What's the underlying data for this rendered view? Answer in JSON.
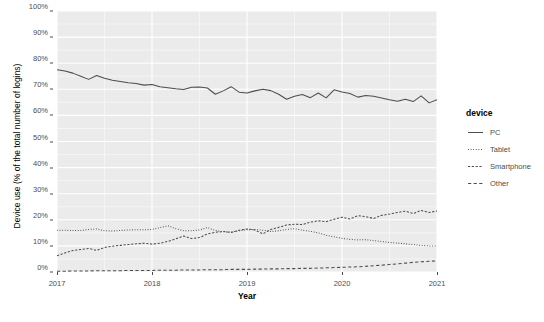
{
  "chart_data": {
    "type": "line",
    "title": "",
    "xlabel": "Year",
    "ylabel": "Device use (% of the total number of logins)",
    "xlim": [
      2017.0,
      2021.0
    ],
    "ylim": [
      0,
      100
    ],
    "grid": true,
    "legend_position": "right",
    "legend_title": "device",
    "x_tick_labels": [
      "2017",
      "2018",
      "2019",
      "2020",
      "2021"
    ],
    "x_tick_values": [
      2017,
      2018,
      2019,
      2020,
      2021
    ],
    "y_tick_labels": [
      "0%",
      "10%",
      "20%",
      "30%",
      "40%",
      "50%",
      "60%",
      "70%",
      "80%",
      "90%",
      "100%"
    ],
    "y_tick_values": [
      0,
      10,
      20,
      30,
      40,
      50,
      60,
      70,
      80,
      90,
      100
    ],
    "x": [
      2017.0,
      2017.083,
      2017.167,
      2017.25,
      2017.333,
      2017.417,
      2017.5,
      2017.583,
      2017.667,
      2017.75,
      2017.833,
      2017.917,
      2018.0,
      2018.083,
      2018.167,
      2018.25,
      2018.333,
      2018.417,
      2018.5,
      2018.583,
      2018.667,
      2018.75,
      2018.833,
      2018.917,
      2019.0,
      2019.083,
      2019.167,
      2019.25,
      2019.333,
      2019.417,
      2019.5,
      2019.583,
      2019.667,
      2019.75,
      2019.833,
      2019.917,
      2020.0,
      2020.083,
      2020.167,
      2020.25,
      2020.333,
      2020.417,
      2020.5,
      2020.583,
      2020.667,
      2020.75,
      2020.833,
      2020.917,
      2021.0
    ],
    "series": [
      {
        "name": "PC",
        "dash": "solid",
        "color": "#4d4d4d",
        "values": [
          77.5,
          77.0,
          76.2,
          75.0,
          73.8,
          75.3,
          74.2,
          73.5,
          73.0,
          72.5,
          72.2,
          71.6,
          71.8,
          71.0,
          70.6,
          70.2,
          69.9,
          70.8,
          70.9,
          70.5,
          68.1,
          69.4,
          71.0,
          68.9,
          68.6,
          69.4,
          70.0,
          69.5,
          68.1,
          66.2,
          67.3,
          68.0,
          66.8,
          68.6,
          66.7,
          69.8,
          69.0,
          68.4,
          67.0,
          67.6,
          67.3,
          66.7,
          66.0,
          65.4,
          66.2,
          65.3,
          67.5,
          64.8,
          66.0
        ]
      },
      {
        "name": "Tablet",
        "dash": "dotted",
        "color": "#4d4d4d",
        "values": [
          16.0,
          16.0,
          15.9,
          15.9,
          16.3,
          16.5,
          15.8,
          15.7,
          15.9,
          16.1,
          16.2,
          16.2,
          16.3,
          17.0,
          17.7,
          16.6,
          15.8,
          15.8,
          16.1,
          17.0,
          15.9,
          15.4,
          15.3,
          15.8,
          16.2,
          16.3,
          16.0,
          15.5,
          15.8,
          16.3,
          16.6,
          16.0,
          15.6,
          15.0,
          14.1,
          13.5,
          12.9,
          12.5,
          12.3,
          12.4,
          12.0,
          11.7,
          11.3,
          11.1,
          10.8,
          10.5,
          10.2,
          10.0,
          10.0
        ]
      },
      {
        "name": "Smartphone",
        "dash": "dashed-short",
        "color": "#4d4d4d",
        "values": [
          6.2,
          7.3,
          8.2,
          8.6,
          9.0,
          8.3,
          9.4,
          9.9,
          10.2,
          10.5,
          10.8,
          11.0,
          10.7,
          11.0,
          11.7,
          12.7,
          13.8,
          12.8,
          13.2,
          14.6,
          15.2,
          15.5,
          15.1,
          16.0,
          16.5,
          16.1,
          14.6,
          16.3,
          17.1,
          18.0,
          18.3,
          18.2,
          19.1,
          19.6,
          19.3,
          20.2,
          21.0,
          20.3,
          21.6,
          21.2,
          20.5,
          21.7,
          22.2,
          22.8,
          23.3,
          22.4,
          23.6,
          22.8,
          23.4
        ]
      },
      {
        "name": "Other",
        "dash": "dashed",
        "color": "#4d4d4d",
        "values": [
          0.3,
          0.3,
          0.4,
          0.4,
          0.4,
          0.5,
          0.5,
          0.5,
          0.5,
          0.6,
          0.6,
          0.6,
          0.6,
          0.7,
          0.7,
          0.7,
          0.8,
          0.8,
          0.8,
          0.9,
          0.9,
          0.9,
          1.0,
          1.0,
          1.0,
          1.1,
          1.1,
          1.2,
          1.2,
          1.3,
          1.3,
          1.4,
          1.4,
          1.5,
          1.6,
          1.7,
          1.8,
          1.9,
          2.0,
          2.2,
          2.4,
          2.6,
          2.9,
          3.1,
          3.4,
          3.7,
          3.9,
          4.1,
          4.3
        ]
      }
    ]
  },
  "legend": {
    "title": "device",
    "items": [
      {
        "label": "PC",
        "dash": "solid"
      },
      {
        "label": "Tablet",
        "dash": "dotted"
      },
      {
        "label": "Smartphone",
        "dash": "dashed-short"
      },
      {
        "label": "Other",
        "dash": "dashed"
      }
    ]
  },
  "axes": {
    "x_title": "Year",
    "y_title": "Device use (% of the total number of logins)"
  },
  "colors": {
    "panel_background": "#ebebeb",
    "grid_major": "#ffffff",
    "grid_minor": "#f5f5f5",
    "line": "#4d4d4d",
    "text": "#4d4d4d",
    "page_background": "#ffffff"
  }
}
